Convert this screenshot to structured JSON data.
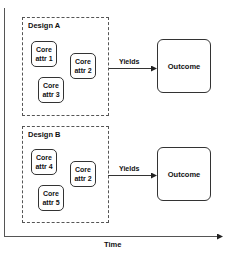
{
  "axes": {
    "x_label": "Time"
  },
  "designs": [
    {
      "title": "Design A",
      "attributes": [
        {
          "line1": "Core",
          "line2": "attr 1"
        },
        {
          "line1": "Core",
          "line2": "attr 2"
        },
        {
          "line1": "Core",
          "line2": "attr 3"
        }
      ],
      "edge_label": "Yields",
      "outcome": "Outcome"
    },
    {
      "title": "Design B",
      "attributes": [
        {
          "line1": "Core",
          "line2": "attr 4"
        },
        {
          "line1": "Core",
          "line2": "attr 2"
        },
        {
          "line1": "Core",
          "line2": "attr 5"
        }
      ],
      "edge_label": "Yields",
      "outcome": "Outcome"
    }
  ],
  "colors": {
    "line": "#333333",
    "dash": "#555555",
    "background": "#ffffff"
  }
}
